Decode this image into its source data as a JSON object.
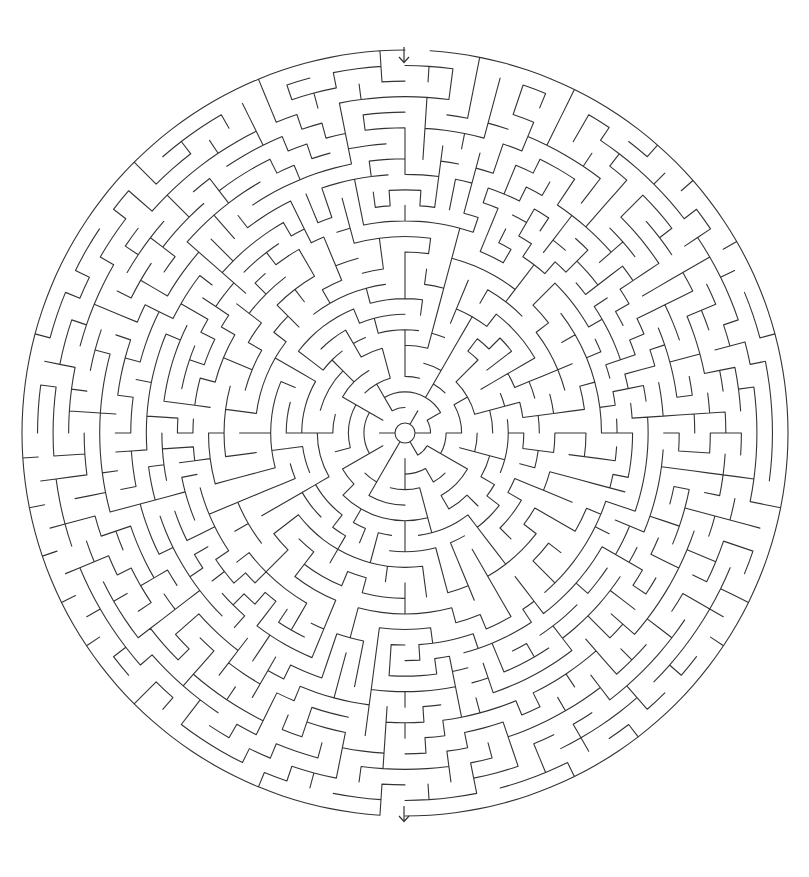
{
  "maze": {
    "type": "circular-theta-maze",
    "center": {
      "x": 405,
      "y": 433
    },
    "outer_radius": 383,
    "inner_radius": 10,
    "ring_count": 24,
    "wall_color": "#333333",
    "background_color": "#ffffff",
    "seed": 20240607,
    "entrance": {
      "label": "entrance",
      "angle_deg": -90,
      "arrow": "down-arrow",
      "arrow_pos": {
        "x": 398,
        "y": 46
      }
    },
    "exit": {
      "label": "exit",
      "angle_deg": 90,
      "arrow": "down-arrow",
      "arrow_pos": {
        "x": 398,
        "y": 805
      }
    }
  }
}
